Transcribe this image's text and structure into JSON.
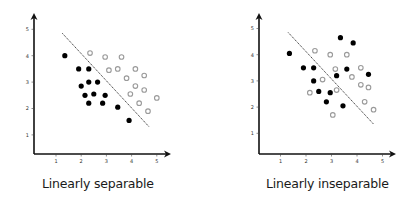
{
  "chart_data": [
    {
      "type": "scatter",
      "title": "Linearly separable",
      "xlabel": "",
      "ylabel": "",
      "xlim": [
        0,
        5.5
      ],
      "ylim": [
        0,
        5.5
      ],
      "x_ticks": [
        "1",
        "2",
        "3",
        "4",
        "5"
      ],
      "y_ticks": [
        "1",
        "2",
        "3",
        "4",
        "5"
      ],
      "grid": false,
      "legend": null,
      "series": [
        {
          "name": "class-black",
          "color": "#000000",
          "marker": "filled-circle",
          "points": [
            [
              1.35,
              4.0
            ],
            [
              1.9,
              3.5
            ],
            [
              2.3,
              3.5
            ],
            [
              2.0,
              2.85
            ],
            [
              2.3,
              3.0
            ],
            [
              2.65,
              3.0
            ],
            [
              2.15,
              2.5
            ],
            [
              2.5,
              2.55
            ],
            [
              2.95,
              2.5
            ],
            [
              2.3,
              2.2
            ],
            [
              2.85,
              2.2
            ],
            [
              3.45,
              2.05
            ],
            [
              3.9,
              1.55
            ]
          ]
        },
        {
          "name": "class-gray",
          "color": "#9a9a9a",
          "marker": "hollow-circle",
          "points": [
            [
              2.35,
              4.1
            ],
            [
              2.95,
              3.95
            ],
            [
              3.6,
              3.95
            ],
            [
              3.1,
              3.45
            ],
            [
              3.45,
              3.5
            ],
            [
              4.15,
              3.5
            ],
            [
              3.8,
              3.15
            ],
            [
              4.5,
              3.25
            ],
            [
              4.15,
              2.85
            ],
            [
              4.5,
              2.7
            ],
            [
              3.95,
              2.55
            ],
            [
              5.0,
              2.4
            ],
            [
              4.3,
              2.2
            ],
            [
              4.65,
              1.9
            ]
          ]
        }
      ],
      "annotations": [
        {
          "type": "dashed-line",
          "from": [
            1.25,
            4.85
          ],
          "to": [
            4.7,
            1.3
          ],
          "label": "decision boundary"
        }
      ]
    },
    {
      "type": "scatter",
      "title": "Linearly inseparable",
      "xlabel": "",
      "ylabel": "",
      "xlim": [
        0,
        5.5
      ],
      "ylim": [
        0,
        5.5
      ],
      "x_ticks": [
        "1",
        "2",
        "3",
        "4",
        "5"
      ],
      "y_ticks": [
        "1",
        "2",
        "3",
        "4",
        "5"
      ],
      "grid": false,
      "legend": null,
      "series": [
        {
          "name": "class-black",
          "color": "#000000",
          "marker": "filled-circle",
          "points": [
            [
              1.35,
              4.05
            ],
            [
              1.9,
              3.5
            ],
            [
              2.3,
              3.5
            ],
            [
              3.35,
              4.65
            ],
            [
              3.85,
              4.45
            ],
            [
              2.3,
              3.0
            ],
            [
              3.2,
              3.2
            ],
            [
              3.6,
              3.45
            ],
            [
              4.45,
              3.25
            ],
            [
              2.5,
              2.6
            ],
            [
              2.95,
              2.55
            ],
            [
              2.8,
              2.2
            ],
            [
              3.45,
              2.05
            ]
          ]
        },
        {
          "name": "class-gray",
          "color": "#9a9a9a",
          "marker": "hollow-circle",
          "points": [
            [
              2.35,
              4.15
            ],
            [
              2.95,
              4.0
            ],
            [
              3.6,
              4.0
            ],
            [
              3.15,
              3.45
            ],
            [
              4.15,
              3.5
            ],
            [
              2.65,
              3.05
            ],
            [
              3.8,
              3.15
            ],
            [
              2.15,
              2.55
            ],
            [
              3.2,
              2.65
            ],
            [
              4.15,
              2.85
            ],
            [
              4.45,
              2.75
            ],
            [
              4.3,
              2.2
            ],
            [
              4.65,
              1.9
            ],
            [
              3.05,
              1.7
            ]
          ]
        }
      ],
      "annotations": [
        {
          "type": "dashed-line",
          "from": [
            1.3,
            4.85
          ],
          "to": [
            4.65,
            1.35
          ],
          "label": "decision boundary"
        }
      ]
    }
  ],
  "charts": {
    "left": {
      "title": "Linearly separable"
    },
    "right": {
      "title": "Linearly inseparable"
    }
  },
  "colors": {
    "black_point": "#000000",
    "gray_point": "#9a9a9a",
    "axis": "#111111"
  }
}
